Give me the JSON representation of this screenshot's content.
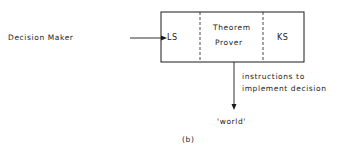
{
  "diagram": {
    "source_label": "Decision Maker",
    "box": {
      "left_section": "LS",
      "middle_section_line1": "Theorem",
      "middle_section_line2": "Prover",
      "right_section": "KS"
    },
    "output_label_line1": "instructions to",
    "output_label_line2": "implement decision",
    "target_label": "'world'",
    "caption": "(b)"
  },
  "colors": {
    "stroke": "#1a1a1a",
    "background": "#ffffff"
  }
}
